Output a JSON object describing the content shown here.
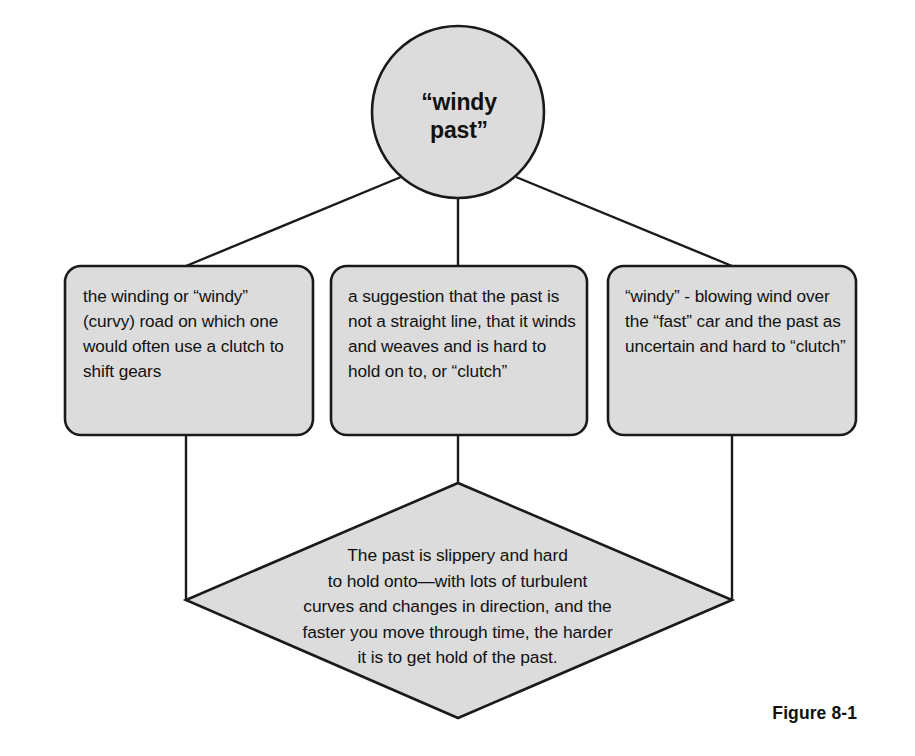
{
  "figure": {
    "caption": "Figure 8-1",
    "central_node": {
      "shape": "circle",
      "label": "“windy\npast”"
    },
    "branches": [
      {
        "id": "left",
        "shape": "rounded-rectangle",
        "label": "the winding or “windy” (curvy) road on which one would often use a clutch to shift gears"
      },
      {
        "id": "middle",
        "shape": "rounded-rectangle",
        "label": "a suggestion that the past is not a straight line, that it winds and weaves and is hard to hold on to, or “clutch”"
      },
      {
        "id": "right",
        "shape": "rounded-rectangle",
        "label": "“windy” - blowing wind over the “fast” car and the past as uncertain and hard to “clutch”"
      }
    ],
    "conclusion": {
      "shape": "diamond",
      "label": "The past is slippery and hard\nto hold onto—with lots of turbulent\ncurves and changes in direction, and the\nfaster you move through time, the harder\nit is to get hold of the past."
    },
    "colors": {
      "shape_fill": "#dcdcdc",
      "stroke": "#1a1a1a",
      "background": "#ffffff",
      "text": "#111111"
    }
  }
}
